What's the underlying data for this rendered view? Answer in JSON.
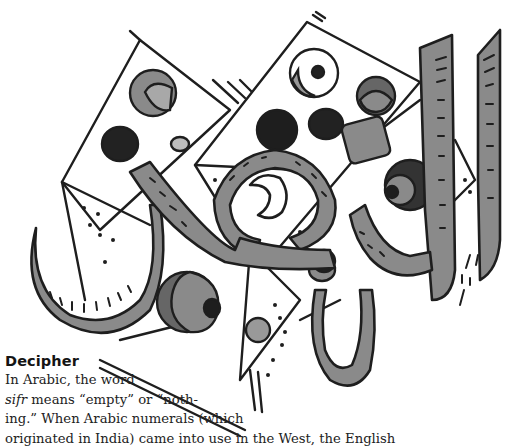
{
  "illustration": {
    "description": "Hand-drawn Arabic calligraphy of the word al-sifr over geometric triangles with dotted and shaded circles",
    "colors": {
      "ink": "#1e1e1e",
      "shade": "#8a8a8a",
      "dark": "#2a2a2a",
      "light": "#bdbdbd",
      "paper": "#ffffff"
    }
  },
  "sidebar": {
    "heading": "Decipher",
    "lines": [
      {
        "pre": "In Arabic, the word",
        "em": "",
        "post": ""
      },
      {
        "pre": "",
        "em": "sifr",
        "post": " means “empty” or “noth-"
      },
      {
        "pre": "ing.” When Arabic numerals (which",
        "em": "",
        "post": ""
      },
      {
        "pre": "originated in India) came into use in the West, the English",
        "em": "",
        "post": ""
      }
    ]
  }
}
